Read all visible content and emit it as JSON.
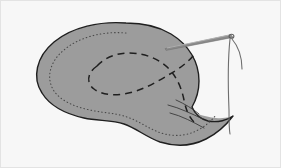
{
  "figure": {
    "caption": ""
  },
  "colors": {
    "background": "#f7f7f7",
    "frame_border": "#e3e3e3",
    "fabric_fill": "#9c9c9c",
    "fabric_fill_shadow": "#8f8f8f",
    "fabric_outline": "#1f1f1f",
    "dotted_guide": "#4a4a4a",
    "dashed_fold": "#1f1f1f",
    "needle_body": "#7a7a7a",
    "needle_highlight": "#b5b5b5",
    "thread": "#6e6e6e"
  },
  "elements": {
    "fabric_panel": {
      "name": "fabric-panel",
      "label": "Fabric panel",
      "shape": "teardrop",
      "fill": "#9c9c9c",
      "stroke": "#1f1f1f",
      "stroke_width": 1.4
    },
    "dotted_guide_line": {
      "name": "dotted-seam-guide",
      "label": "Dotted seam guideline",
      "stroke": "#4a4a4a",
      "stroke_width": 1.1,
      "dash_pattern": "0.6 3"
    },
    "dashed_fold_line": {
      "name": "dashed-fold-line",
      "label": "Dashed fold line",
      "stroke": "#1f1f1f",
      "stroke_width": 1.5,
      "dash_pattern": "7 5"
    },
    "tail_crease_lines": {
      "name": "tail-crease-lines",
      "label": "Tail crease lines",
      "stroke": "#3a3a3a",
      "stroke_width": 0.9,
      "count": 3
    },
    "needle": {
      "name": "sewing-needle",
      "label": "Sewing needle",
      "stroke": "#7a7a7a",
      "tip_x": 165,
      "tip_y": 48,
      "eye_x": 232,
      "eye_y": 36
    },
    "thread": {
      "name": "thread",
      "label": "Thread",
      "stroke": "#6e6e6e",
      "stroke_width": 1.1,
      "loop_end_x": 243,
      "loop_end_y": 70,
      "tail_end_x": 230,
      "tail_end_y": 133
    }
  }
}
